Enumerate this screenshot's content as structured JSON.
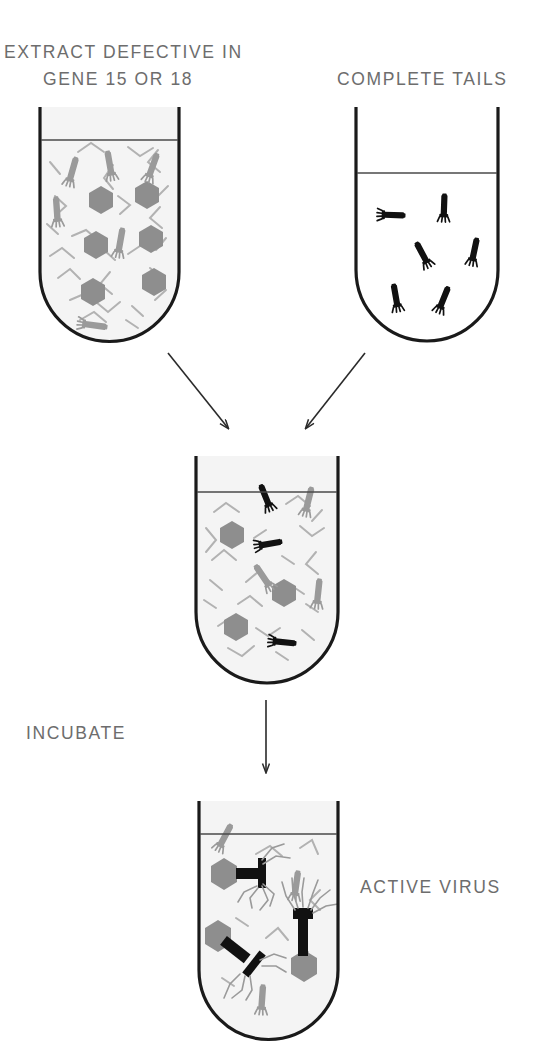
{
  "figure": {
    "type": "scientific-diagram",
    "background_color": "#ffffff",
    "labels": {
      "top_left_line1": "EXTRACT DEFECTIVE IN",
      "top_left_line2": "GENE 15 OR 18",
      "top_right": "COMPLETE TAILS",
      "incubate": "INCUBATE",
      "active_virus": "ACTIVE VIRUS"
    },
    "colors": {
      "outline": "#1a1a1a",
      "liquid_line": "#4a4a4a",
      "head_gray": "#8e8e8e",
      "tail_gray": "#9a9a9a",
      "fragment_gray": "#b2b2b2",
      "tail_black": "#111111",
      "fluid_fill": "#f4f4f4",
      "label_text": "#6d6d6d",
      "arrow": "#2a2a2a"
    },
    "tubes": [
      {
        "id": "tube-extract",
        "name": "extract-defective-tube",
        "label_key": "top_left_line1",
        "x": 40,
        "y": 107,
        "width": 139,
        "height": 234,
        "liquid_y": 140,
        "fluid_filled": true,
        "contents": {
          "heads": 6,
          "gray_tails": 6,
          "fragments": 26,
          "black_tails": 0,
          "assembled_virus": 0
        }
      },
      {
        "id": "tube-tails",
        "name": "complete-tails-tube",
        "label_key": "top_right",
        "x": 356,
        "y": 107,
        "width": 142,
        "height": 234,
        "liquid_y": 173,
        "fluid_filled": false,
        "contents": {
          "heads": 0,
          "gray_tails": 0,
          "fragments": 0,
          "black_tails": 6,
          "assembled_virus": 0
        }
      },
      {
        "id": "tube-mixture",
        "name": "mixture-tube",
        "label_key": "",
        "x": 196,
        "y": 456,
        "width": 142,
        "height": 227,
        "liquid_y": 492,
        "fluid_filled": true,
        "contents": {
          "heads": 3,
          "gray_tails": 3,
          "fragments": 20,
          "black_tails": 3,
          "assembled_virus": 0
        }
      },
      {
        "id": "tube-active",
        "name": "active-virus-tube",
        "label_key": "active_virus",
        "x": 199,
        "y": 801,
        "width": 139,
        "height": 238,
        "liquid_y": 834,
        "fluid_filled": true,
        "contents": {
          "heads": 0,
          "gray_tails": 3,
          "fragments": 7,
          "black_tails": 0,
          "assembled_virus": 3
        }
      }
    ],
    "arrows": [
      {
        "id": "arrow-left",
        "name": "arrow-extract-to-mixture",
        "x1": 168,
        "y1": 353,
        "x2": 228,
        "y2": 430
      },
      {
        "id": "arrow-right",
        "name": "arrow-tails-to-mixture",
        "x1": 365,
        "y1": 353,
        "x2": 306,
        "y2": 430
      },
      {
        "id": "arrow-incubate",
        "name": "arrow-incubate-down",
        "x1": 266,
        "y1": 700,
        "x2": 266,
        "y2": 775
      }
    ]
  }
}
